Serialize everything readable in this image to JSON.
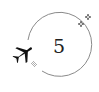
{
  "badge": {
    "number": "5",
    "icons": [
      "airplane-icon",
      "sparkle-icon",
      "sparkle-icon"
    ],
    "colors": {
      "ring": "#8a8a8a",
      "plane": "#111111",
      "text": "#222222",
      "background": "#ffffff"
    }
  }
}
